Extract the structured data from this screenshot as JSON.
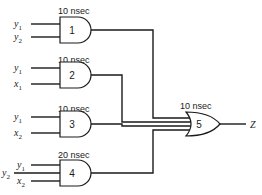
{
  "diagram": {
    "title": "",
    "gates": [
      {
        "id": "1",
        "type": "AND",
        "delay": "10 nsec",
        "inputs": [
          {
            "var": "y",
            "sub": "1"
          },
          {
            "var": "y",
            "sub": "2"
          }
        ]
      },
      {
        "id": "2",
        "type": "AND",
        "delay": "10 nsec",
        "inputs": [
          {
            "var": "y",
            "sub": "1"
          },
          {
            "var": "x",
            "sub": "1"
          }
        ]
      },
      {
        "id": "3",
        "type": "AND",
        "delay": "10 nsec",
        "inputs": [
          {
            "var": "y",
            "sub": "1"
          },
          {
            "var": "x",
            "sub": "2"
          }
        ]
      },
      {
        "id": "4",
        "type": "AND",
        "delay": "20 nsec",
        "inputs": [
          {
            "var": "y",
            "sub": "1"
          },
          {
            "var": "y",
            "sub": "2"
          },
          {
            "var": "x",
            "sub": "2"
          }
        ]
      },
      {
        "id": "5",
        "type": "OR",
        "delay": "10 nsec",
        "inputs": [
          "gate1",
          "gate2",
          "gate3",
          "gate4"
        ]
      }
    ],
    "output": {
      "var": "Z"
    }
  }
}
